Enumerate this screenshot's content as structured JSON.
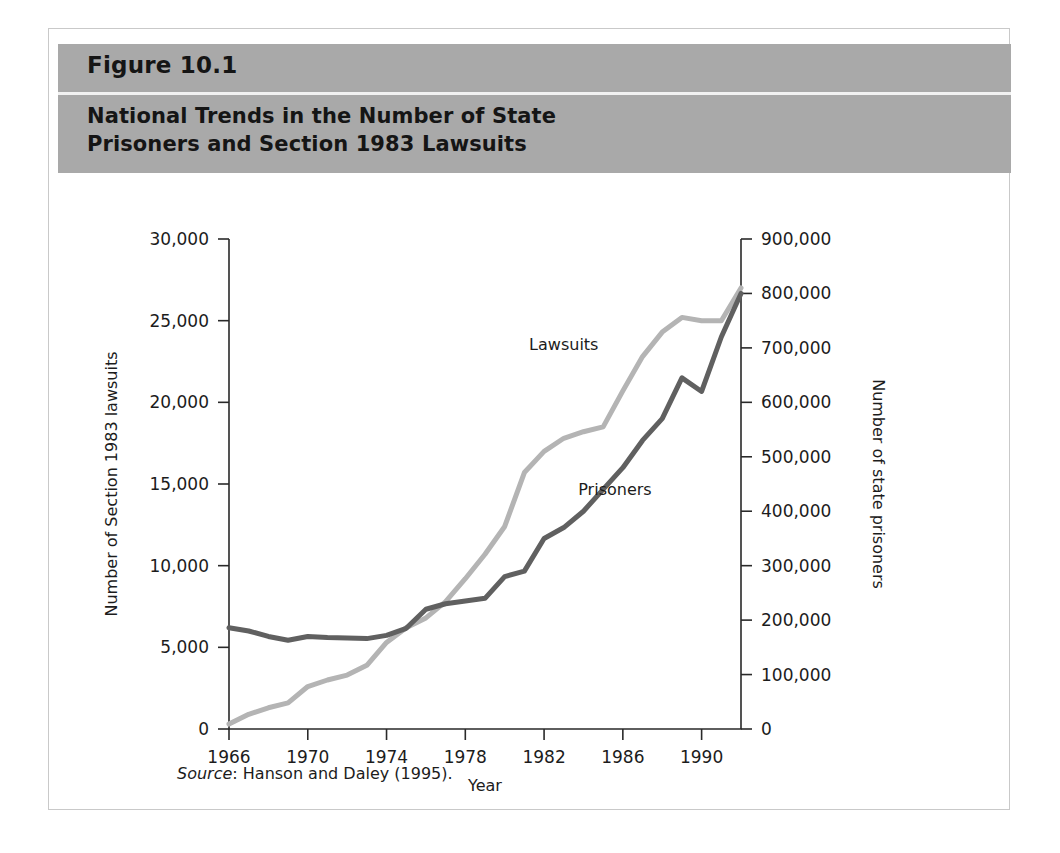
{
  "figure": {
    "number": "Figure 10.1",
    "title": "National Trends in the Number of State\nPrisoners and Section 1983 Lawsuits",
    "title_line1": "National Trends in the Number of State",
    "title_line2": "Prisoners and Section 1983 Lawsuits",
    "header_bg": "#a9a9a9",
    "source_prefix": "Source",
    "source_rest": ": Hanson and Daley (1995)."
  },
  "chart_data": {
    "type": "line",
    "title": "National Trends in the Number of State Prisoners and Section 1983 Lawsuits",
    "xlabel": "Year",
    "ylabel": "Number of Section 1983 lawsuits",
    "y2label": "Number of state prisoners",
    "xlim": [
      1966,
      1992
    ],
    "ylim": [
      0,
      30000
    ],
    "y2lim": [
      0,
      900000
    ],
    "grid": false,
    "legend": "inline-labels",
    "xticks": [
      1966,
      1970,
      1974,
      1978,
      1982,
      1986,
      1990
    ],
    "xtick_labels": [
      "1966",
      "1970",
      "1974",
      "1978",
      "1982",
      "1986",
      "1990"
    ],
    "yticks": [
      0,
      5000,
      10000,
      15000,
      20000,
      25000,
      30000
    ],
    "ytick_labels": [
      "0",
      "5,000",
      "10,000",
      "15,000",
      "20,000",
      "25,000",
      "30,000"
    ],
    "y2ticks": [
      0,
      100000,
      200000,
      300000,
      400000,
      500000,
      600000,
      700000,
      800000,
      900000
    ],
    "y2tick_labels": [
      "0",
      "100,000",
      "200,000",
      "300,000",
      "400,000",
      "500,000",
      "600,000",
      "700,000",
      "800,000",
      "900,000"
    ],
    "x": [
      1966,
      1967,
      1968,
      1969,
      1970,
      1971,
      1972,
      1973,
      1974,
      1975,
      1976,
      1977,
      1978,
      1979,
      1980,
      1981,
      1982,
      1983,
      1984,
      1985,
      1986,
      1987,
      1988,
      1989,
      1990,
      1991,
      1992
    ],
    "series": [
      {
        "name": "Lawsuits",
        "axis": "left",
        "color": "#b4b4b4",
        "label_x": 1983.0,
        "label_y": 23200,
        "values": [
          300,
          900,
          1300,
          1600,
          2600,
          3000,
          3300,
          3900,
          5300,
          6200,
          6800,
          7800,
          9200,
          10700,
          12400,
          15700,
          17000,
          17800,
          18200,
          18500,
          20700,
          22800,
          24300,
          25200,
          25000,
          25000,
          27000
        ]
      },
      {
        "name": "Prisoners",
        "axis": "right",
        "color": "#606060",
        "label_x": 1985.6,
        "label_y": 14300,
        "values": [
          186000,
          180000,
          170000,
          163000,
          170000,
          168000,
          167000,
          166000,
          172000,
          185000,
          220000,
          230000,
          235000,
          240000,
          280000,
          290000,
          350000,
          370000,
          400000,
          440000,
          480000,
          530000,
          570000,
          645000,
          620000,
          720000,
          800000
        ]
      }
    ],
    "annotations": [
      {
        "text": "Lawsuits",
        "series": "Lawsuits"
      },
      {
        "text": "Prisoners",
        "series": "Prisoners"
      }
    ],
    "source": "Source: Hanson and Daley (1995)."
  }
}
